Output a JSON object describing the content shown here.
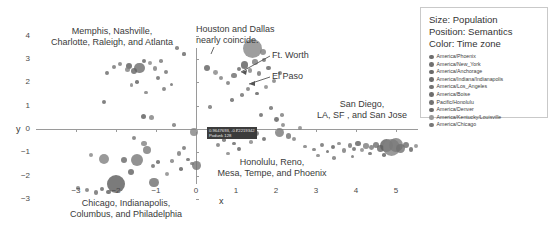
{
  "chart_data": {
    "type": "scatter",
    "title": "",
    "xlabel": "x",
    "ylabel": "y",
    "xlim": [
      -3.6,
      5.8
    ],
    "ylim": [
      -3.6,
      4.4
    ],
    "xticks": [
      "-3",
      "-2",
      "-1",
      "0",
      "1",
      "2",
      "3",
      "4",
      "5"
    ],
    "yticks": [
      "4",
      "3",
      "2",
      "1",
      "0",
      "-1",
      "-2",
      "-3"
    ],
    "grid": false,
    "legend_position": "right-outside",
    "size_encoding": "Population",
    "position_encoding": "Semantics",
    "color_encoding": "Time zone",
    "points": [
      {
        "x": -2.0,
        "y": -2.35,
        "r": 9.0
      },
      {
        "x": -2.3,
        "y": -1.28,
        "r": 5.2
      },
      {
        "x": -1.48,
        "y": -1.32,
        "r": 6.0
      },
      {
        "x": -1.05,
        "y": -2.3,
        "r": 4.6
      },
      {
        "x": -1.8,
        "y": -1.33,
        "r": 3.4
      },
      {
        "x": -1.62,
        "y": -1.85,
        "r": 3.0
      },
      {
        "x": -2.62,
        "y": -1.12,
        "r": 2.2
      },
      {
        "x": -2.95,
        "y": -2.52,
        "r": 1.8
      },
      {
        "x": -2.72,
        "y": -2.62,
        "r": 2.0
      },
      {
        "x": -2.5,
        "y": -2.72,
        "r": 2.2
      },
      {
        "x": -2.35,
        "y": -2.58,
        "r": 1.9
      },
      {
        "x": -2.18,
        "y": -2.7,
        "r": 2.4
      },
      {
        "x": -1.3,
        "y": -0.62,
        "r": 2.6
      },
      {
        "x": -1.22,
        "y": -0.9,
        "r": 4.2
      },
      {
        "x": -1.55,
        "y": -0.4,
        "r": 2.0
      },
      {
        "x": -1.08,
        "y": -1.6,
        "r": 2.2
      },
      {
        "x": -0.95,
        "y": -1.42,
        "r": 1.8
      },
      {
        "x": -0.72,
        "y": -1.95,
        "r": 2.0
      },
      {
        "x": -0.6,
        "y": -1.38,
        "r": 1.7
      },
      {
        "x": -0.42,
        "y": -1.05,
        "r": 2.1
      },
      {
        "x": -0.3,
        "y": -0.8,
        "r": 1.9
      },
      {
        "x": -0.2,
        "y": -1.3,
        "r": 1.6
      },
      {
        "x": -0.38,
        "y": -1.72,
        "r": 1.8
      },
      {
        "x": -0.05,
        "y": -0.12,
        "r": 4.0
      },
      {
        "x": -0.1,
        "y": -1.48,
        "r": 1.7
      },
      {
        "x": 0.02,
        "y": -1.58,
        "r": 4.4
      },
      {
        "x": -1.42,
        "y": 2.62,
        "r": 5.4
      },
      {
        "x": -1.55,
        "y": 2.5,
        "r": 3.2
      },
      {
        "x": -1.68,
        "y": 2.72,
        "r": 3.0
      },
      {
        "x": -1.72,
        "y": 2.55,
        "r": 2.6
      },
      {
        "x": -1.9,
        "y": 2.78,
        "r": 2.2
      },
      {
        "x": -2.05,
        "y": 2.65,
        "r": 2.0
      },
      {
        "x": -2.22,
        "y": 2.42,
        "r": 1.9
      },
      {
        "x": -1.3,
        "y": 2.9,
        "r": 2.0
      },
      {
        "x": -1.15,
        "y": 2.82,
        "r": 2.1
      },
      {
        "x": -1.02,
        "y": 2.6,
        "r": 2.3
      },
      {
        "x": -0.88,
        "y": 2.92,
        "r": 1.8
      },
      {
        "x": -0.75,
        "y": 2.45,
        "r": 2.0
      },
      {
        "x": -0.95,
        "y": 2.18,
        "r": 2.2
      },
      {
        "x": -1.48,
        "y": 2.02,
        "r": 1.8
      },
      {
        "x": -1.62,
        "y": 1.88,
        "r": 1.7
      },
      {
        "x": -1.25,
        "y": 1.55,
        "r": 1.6
      },
      {
        "x": -0.8,
        "y": 1.72,
        "r": 1.9
      },
      {
        "x": -0.62,
        "y": 1.92,
        "r": 1.7
      },
      {
        "x": -2.3,
        "y": 1.18,
        "r": 2.0
      },
      {
        "x": -1.32,
        "y": 0.52,
        "r": 2.6
      },
      {
        "x": -1.12,
        "y": 0.5,
        "r": 2.6
      },
      {
        "x": -0.55,
        "y": 0.18,
        "r": 1.8
      },
      {
        "x": -0.48,
        "y": 3.48,
        "r": 1.8
      },
      {
        "x": -0.3,
        "y": 3.22,
        "r": 1.6
      },
      {
        "x": 0.28,
        "y": 2.62,
        "r": 3.0
      },
      {
        "x": 0.48,
        "y": 2.42,
        "r": 2.4
      },
      {
        "x": 0.62,
        "y": 2.18,
        "r": 2.2
      },
      {
        "x": 0.8,
        "y": 1.98,
        "r": 2.0
      },
      {
        "x": 0.95,
        "y": 2.3,
        "r": 2.6
      },
      {
        "x": 1.08,
        "y": 2.58,
        "r": 2.2
      },
      {
        "x": 1.22,
        "y": 2.75,
        "r": 3.6
      },
      {
        "x": 1.35,
        "y": 2.52,
        "r": 2.4
      },
      {
        "x": 1.48,
        "y": 2.88,
        "r": 2.8
      },
      {
        "x": 1.58,
        "y": 2.38,
        "r": 2.2
      },
      {
        "x": 1.7,
        "y": 2.95,
        "r": 2.0
      },
      {
        "x": 1.82,
        "y": 2.62,
        "r": 2.4
      },
      {
        "x": 1.4,
        "y": 3.45,
        "r": 9.5
      },
      {
        "x": 1.68,
        "y": 3.3,
        "r": 3.2
      },
      {
        "x": 1.3,
        "y": 1.7,
        "r": 2.0
      },
      {
        "x": 1.15,
        "y": 1.45,
        "r": 1.8
      },
      {
        "x": 0.9,
        "y": 1.25,
        "r": 1.7
      },
      {
        "x": 1.52,
        "y": 1.52,
        "r": 1.9
      },
      {
        "x": 1.75,
        "y": 1.8,
        "r": 2.0
      },
      {
        "x": 1.95,
        "y": 2.05,
        "r": 2.2
      },
      {
        "x": 2.1,
        "y": 2.42,
        "r": 2.0
      },
      {
        "x": 1.88,
        "y": 0.9,
        "r": 1.8
      },
      {
        "x": 1.62,
        "y": 0.62,
        "r": 2.0
      },
      {
        "x": 2.02,
        "y": 0.4,
        "r": 2.4
      },
      {
        "x": 2.18,
        "y": 0.18,
        "r": 2.0
      },
      {
        "x": 2.08,
        "y": -0.15,
        "r": 4.6
      },
      {
        "x": 2.32,
        "y": -0.3,
        "r": 2.6
      },
      {
        "x": 1.52,
        "y": -0.18,
        "r": 2.4
      },
      {
        "x": 1.7,
        "y": -0.42,
        "r": 2.0
      },
      {
        "x": 1.38,
        "y": -0.55,
        "r": 1.8
      },
      {
        "x": 2.45,
        "y": -0.45,
        "r": 2.0
      },
      {
        "x": 0.55,
        "y": -0.7,
        "r": 2.0
      },
      {
        "x": 0.7,
        "y": -0.48,
        "r": 1.8
      },
      {
        "x": 0.95,
        "y": -0.62,
        "r": 1.7
      },
      {
        "x": 1.08,
        "y": -0.85,
        "r": 1.9
      },
      {
        "x": 0.8,
        "y": -1.05,
        "r": 1.6
      },
      {
        "x": 2.72,
        "y": -0.75,
        "r": 1.8
      },
      {
        "x": 2.95,
        "y": -0.88,
        "r": 1.7
      },
      {
        "x": 3.15,
        "y": -0.7,
        "r": 1.9
      },
      {
        "x": 3.28,
        "y": -0.95,
        "r": 1.6
      },
      {
        "x": 3.42,
        "y": -0.78,
        "r": 2.0
      },
      {
        "x": 3.58,
        "y": -0.62,
        "r": 1.8
      },
      {
        "x": 3.7,
        "y": -0.92,
        "r": 2.2
      },
      {
        "x": 3.85,
        "y": -0.7,
        "r": 2.4
      },
      {
        "x": 3.95,
        "y": -0.85,
        "r": 2.0
      },
      {
        "x": 4.05,
        "y": -0.62,
        "r": 2.6
      },
      {
        "x": 4.15,
        "y": -0.9,
        "r": 2.2
      },
      {
        "x": 4.25,
        "y": -0.72,
        "r": 2.8
      },
      {
        "x": 4.38,
        "y": -0.8,
        "r": 2.4
      },
      {
        "x": 4.5,
        "y": -0.68,
        "r": 3.0
      },
      {
        "x": 4.62,
        "y": -0.85,
        "r": 3.4
      },
      {
        "x": 4.75,
        "y": -0.72,
        "r": 6.5
      },
      {
        "x": 4.88,
        "y": -0.78,
        "r": 8.5
      },
      {
        "x": 5.0,
        "y": -0.7,
        "r": 7.0
      },
      {
        "x": 5.12,
        "y": -0.82,
        "r": 4.5
      },
      {
        "x": 5.25,
        "y": -0.68,
        "r": 3.0
      },
      {
        "x": 5.38,
        "y": -0.88,
        "r": 2.2
      },
      {
        "x": 5.5,
        "y": -0.72,
        "r": 2.0
      },
      {
        "x": 3.05,
        "y": -1.15,
        "r": 1.6
      },
      {
        "x": 3.45,
        "y": -1.25,
        "r": 1.8
      },
      {
        "x": 3.92,
        "y": -1.18,
        "r": 1.7
      },
      {
        "x": 4.35,
        "y": -1.05,
        "r": 1.9
      },
      {
        "x": 4.7,
        "y": -1.12,
        "r": 1.8
      },
      {
        "x": 2.6,
        "y": 0.05,
        "r": 2.0
      },
      {
        "x": 2.15,
        "y": 0.6,
        "r": 1.8
      },
      {
        "x": 0.35,
        "y": 0.95,
        "r": 1.7
      }
    ],
    "annotations": [
      {
        "id": "memphis",
        "text": "Memphis, Nashville,\nCharlotte, Raleigh, and Atlanta"
      },
      {
        "id": "houston",
        "text": "Houston and Dallas\nnearly coincide."
      },
      {
        "id": "ftworth",
        "text": "Ft. Worth"
      },
      {
        "id": "elpaso",
        "text": "El Paso"
      },
      {
        "id": "sandiego",
        "text": "San Diego,\nLA, SF , and San Jose"
      },
      {
        "id": "honolulu",
        "text": "Honolulu, Reno,\nMesa, Tempe, and Phoenix"
      },
      {
        "id": "chicago",
        "text": "Chicago, Indianapolis,\nColumbus, and Philadelphia"
      }
    ]
  },
  "legend": {
    "header_size": "Size: Population",
    "header_position": "Position: Semantics",
    "header_color": "Color: Time zone",
    "items": [
      {
        "label": "America/Phoenix",
        "color": "#6e6e6e"
      },
      {
        "label": "America/New_York",
        "color": "#707070"
      },
      {
        "label": "America/Anchorage",
        "color": "#6a6a6a"
      },
      {
        "label": "America/Indiana/Indianapolis",
        "color": "#6c6c6c"
      },
      {
        "label": "America/Los_Angeles",
        "color": "#747474"
      },
      {
        "label": "America/Boise",
        "color": "#6d6d6d"
      },
      {
        "label": "Pacific/Honolulu",
        "color": "#737373"
      },
      {
        "label": "America/Denver",
        "color": "#6b6b6b"
      },
      {
        "label": "America/Kentucky/Louisville",
        "color": "#9a9a9a"
      },
      {
        "label": "America/Chicago",
        "color": "#787878"
      }
    ]
  },
  "tooltip": {
    "line1": "0.9647693, -0.72219342",
    "line2": "Podunk 128"
  },
  "axis": {
    "x_name": "x",
    "y_name": "y"
  }
}
